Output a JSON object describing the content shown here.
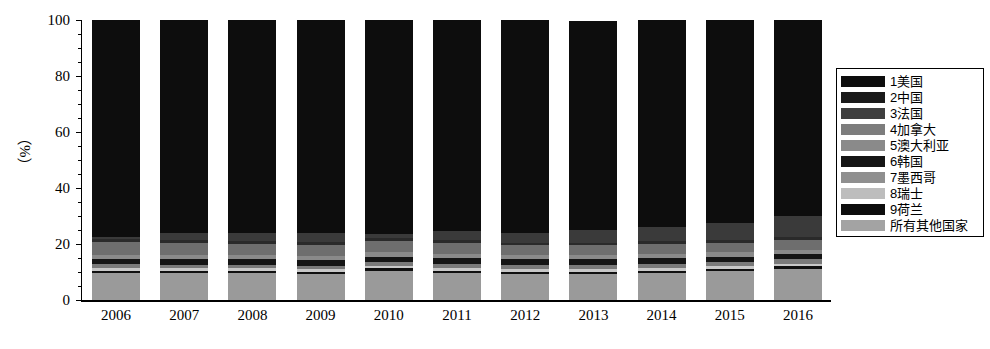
{
  "chart_data": {
    "type": "bar",
    "title": "",
    "subtitle": "",
    "xlabel": "",
    "ylabel": "（%）",
    "ylim": [
      0,
      100
    ],
    "yticks": [
      0,
      20,
      40,
      60,
      80,
      100
    ],
    "grid": false,
    "stacked": true,
    "stack_normalized_percent": true,
    "legend_position": "right",
    "categories": [
      "2006",
      "2007",
      "2008",
      "2009",
      "2010",
      "2011",
      "2012",
      "2013",
      "2014",
      "2015",
      "2016"
    ],
    "series": [
      {
        "name": "1美国",
        "color": "#0d0d0d",
        "values": [
          77.5,
          76.0,
          76.0,
          76.0,
          76.5,
          75.5,
          76.0,
          74.5,
          74.0,
          72.5,
          70.0
        ]
      },
      {
        "name": "2中国",
        "color": "#3a3a3a",
        "values": [
          0.8,
          2.5,
          3.0,
          3.2,
          1.5,
          3.2,
          3.5,
          4.5,
          5.0,
          6.0,
          7.5
        ]
      },
      {
        "name": "3法国",
        "color": "#2a2a2a",
        "values": [
          1.0,
          1.0,
          1.0,
          1.0,
          1.0,
          1.0,
          1.0,
          1.0,
          1.0,
          1.0,
          1.0
        ]
      },
      {
        "name": "4加拿大",
        "color": "#6e6e6e",
        "values": [
          4.5,
          4.5,
          4.0,
          4.0,
          4.0,
          3.8,
          3.5,
          3.5,
          3.5,
          3.5,
          3.5
        ]
      },
      {
        "name": "5澳大利亚",
        "color": "#8a8a8a",
        "values": [
          1.5,
          1.5,
          1.5,
          1.5,
          1.5,
          1.5,
          1.5,
          1.5,
          1.5,
          1.5,
          1.5
        ]
      },
      {
        "name": "6韩国",
        "color": "#151515",
        "values": [
          2.0,
          2.0,
          2.0,
          2.0,
          2.0,
          2.0,
          2.0,
          2.0,
          2.0,
          2.0,
          2.0
        ]
      },
      {
        "name": "7墨西哥",
        "color": "#7a7a7a",
        "values": [
          1.2,
          1.2,
          1.2,
          1.2,
          1.2,
          1.5,
          1.5,
          1.5,
          1.5,
          1.5,
          1.5
        ]
      },
      {
        "name": "8瑞士",
        "color": "#c8c8c8",
        "values": [
          1.0,
          1.0,
          1.0,
          1.0,
          1.0,
          1.0,
          1.0,
          1.0,
          1.0,
          1.0,
          1.0
        ]
      },
      {
        "name": "9荷兰",
        "color": "#101010",
        "values": [
          0.8,
          0.8,
          0.8,
          0.8,
          0.8,
          0.8,
          0.8,
          0.8,
          0.8,
          0.8,
          0.8
        ]
      },
      {
        "name": "所有其他国家",
        "color": "#9a9a9a",
        "values": [
          9.7,
          9.5,
          9.5,
          9.3,
          10.5,
          9.7,
          9.2,
          9.2,
          9.7,
          10.2,
          11.2
        ]
      }
    ],
    "bar_totals": [
      100.0,
      100.0,
      100.0,
      100.0,
      100.0,
      99.0,
      100.0,
      99.5,
      99.0,
      99.0,
      99.0
    ]
  },
  "legend": {
    "entries": [
      {
        "label": "1美国",
        "color": "#0d0d0d"
      },
      {
        "label": "2中国",
        "color": "#1a1a1a"
      },
      {
        "label": "3法国",
        "color": "#3f3f3f"
      },
      {
        "label": "4加拿大",
        "color": "#7d7d7d"
      },
      {
        "label": "5澳大利亚",
        "color": "#8a8a8a"
      },
      {
        "label": "6韩国",
        "color": "#151515"
      },
      {
        "label": "7墨西哥",
        "color": "#8f8f8f"
      },
      {
        "label": "8瑞士",
        "color": "#bdbdbd"
      },
      {
        "label": "9荷兰",
        "color": "#0d0d0d"
      },
      {
        "label": "所有其他国家",
        "color": "#a3a3a3"
      }
    ]
  }
}
